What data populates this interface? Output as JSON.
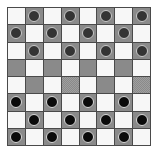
{
  "scene": {
    "title": "Checkers board",
    "background_color": "#ffffff",
    "board": {
      "rows": 8,
      "columns": 8,
      "light_square_color": "#f7f7f7",
      "dark_square_color": "#8a8a8a",
      "grid_line_color": "#4a4a4a",
      "top_piece_color": "#343434",
      "bottom_piece_color": "#0b0b0b",
      "piece_outline_color": "#d0d0d0",
      "top_piece_count": 12,
      "bottom_piece_count": 12,
      "empty_rows": [
        4,
        5
      ],
      "squares": [
        [
          {
            "shade": "light",
            "piece": "none"
          },
          {
            "shade": "dark",
            "piece": "top"
          },
          {
            "shade": "light",
            "piece": "none"
          },
          {
            "shade": "dark",
            "piece": "top"
          },
          {
            "shade": "light",
            "piece": "none"
          },
          {
            "shade": "dark",
            "piece": "top"
          },
          {
            "shade": "light",
            "piece": "none"
          },
          {
            "shade": "dark",
            "piece": "top"
          }
        ],
        [
          {
            "shade": "dark",
            "piece": "top"
          },
          {
            "shade": "light",
            "piece": "none"
          },
          {
            "shade": "dark",
            "piece": "top"
          },
          {
            "shade": "light",
            "piece": "none"
          },
          {
            "shade": "dark",
            "piece": "top"
          },
          {
            "shade": "light",
            "piece": "none"
          },
          {
            "shade": "dark",
            "piece": "top"
          },
          {
            "shade": "light",
            "piece": "none"
          }
        ],
        [
          {
            "shade": "light",
            "piece": "none"
          },
          {
            "shade": "dark",
            "piece": "top"
          },
          {
            "shade": "light",
            "piece": "none"
          },
          {
            "shade": "dark",
            "piece": "top"
          },
          {
            "shade": "light",
            "piece": "none"
          },
          {
            "shade": "dark",
            "piece": "top"
          },
          {
            "shade": "light",
            "piece": "none"
          },
          {
            "shade": "dark",
            "piece": "top"
          }
        ],
        [
          {
            "shade": "dark",
            "piece": "none"
          },
          {
            "shade": "light",
            "piece": "none"
          },
          {
            "shade": "dark",
            "piece": "none"
          },
          {
            "shade": "light",
            "piece": "none"
          },
          {
            "shade": "dark",
            "piece": "none"
          },
          {
            "shade": "light",
            "piece": "none"
          },
          {
            "shade": "dark",
            "piece": "none"
          },
          {
            "shade": "light",
            "piece": "none"
          }
        ],
        [
          {
            "shade": "light",
            "piece": "none"
          },
          {
            "shade": "dark",
            "piece": "none"
          },
          {
            "shade": "light",
            "piece": "none"
          },
          {
            "shade": "dark",
            "piece": "none"
          },
          {
            "shade": "light",
            "piece": "none"
          },
          {
            "shade": "dark",
            "piece": "none"
          },
          {
            "shade": "light",
            "piece": "none"
          },
          {
            "shade": "dark",
            "piece": "none"
          }
        ],
        [
          {
            "shade": "dark",
            "piece": "bottom"
          },
          {
            "shade": "light",
            "piece": "none"
          },
          {
            "shade": "dark",
            "piece": "bottom"
          },
          {
            "shade": "light",
            "piece": "none"
          },
          {
            "shade": "dark",
            "piece": "bottom"
          },
          {
            "shade": "light",
            "piece": "none"
          },
          {
            "shade": "dark",
            "piece": "bottom"
          },
          {
            "shade": "light",
            "piece": "none"
          }
        ],
        [
          {
            "shade": "light",
            "piece": "none"
          },
          {
            "shade": "dark",
            "piece": "bottom"
          },
          {
            "shade": "light",
            "piece": "none"
          },
          {
            "shade": "dark",
            "piece": "bottom"
          },
          {
            "shade": "light",
            "piece": "none"
          },
          {
            "shade": "dark",
            "piece": "bottom"
          },
          {
            "shade": "light",
            "piece": "none"
          },
          {
            "shade": "dark",
            "piece": "bottom"
          }
        ],
        [
          {
            "shade": "dark",
            "piece": "bottom"
          },
          {
            "shade": "light",
            "piece": "none"
          },
          {
            "shade": "dark",
            "piece": "bottom"
          },
          {
            "shade": "light",
            "piece": "none"
          },
          {
            "shade": "dark",
            "piece": "bottom"
          },
          {
            "shade": "light",
            "piece": "none"
          },
          {
            "shade": "dark",
            "piece": "bottom"
          },
          {
            "shade": "light",
            "piece": "none"
          }
        ]
      ]
    }
  }
}
